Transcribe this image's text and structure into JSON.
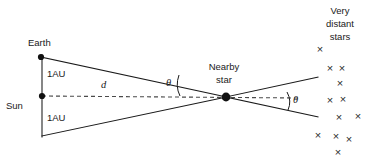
{
  "diagram": {
    "background_color": "#ffffff",
    "line_color": "#1a1a1a",
    "dash_color": "#4a4a4a",
    "labels": {
      "earth": "Earth",
      "sun": "Sun",
      "au_top": "1AU",
      "au_bottom": "1AU",
      "distance": "d",
      "theta_left": "θ",
      "theta_right": "θ",
      "nearby_star_line1": "Nearby",
      "nearby_star_line2": "star",
      "distant_line1": "Very",
      "distant_line2": "distant",
      "distant_line3": "stars"
    },
    "nodes": [
      {
        "name": "earth",
        "x": 41,
        "y": 57,
        "radius": 3.1
      },
      {
        "name": "sun",
        "x": 42,
        "y": 96,
        "radius": 3.1
      },
      {
        "name": "nearby-star",
        "x": 226,
        "y": 97,
        "radius": 4.4
      }
    ],
    "baseline": {
      "x": 42,
      "y_top": 57,
      "y_bottom": 136
    },
    "sight_lines": [
      {
        "name": "earth-to-star",
        "x1": 41,
        "y1": 57,
        "x2": 226,
        "y2": 97
      },
      {
        "name": "opposition-to-star",
        "x1": 42,
        "y1": 136,
        "x2": 226,
        "y2": 97
      },
      {
        "name": "star-to-distant-upper",
        "x1": 226,
        "y1": 97,
        "x2": 318,
        "y2": 77
      },
      {
        "name": "star-to-distant-lower",
        "x1": 226,
        "y1": 97,
        "x2": 318,
        "y2": 117
      }
    ],
    "dashed_axis": {
      "x1": 42,
      "y1": 96,
      "x2": 300,
      "y2": 98
    },
    "distant_stars": [
      {
        "x": 320,
        "y": 50
      },
      {
        "x": 330,
        "y": 69
      },
      {
        "x": 342,
        "y": 69
      },
      {
        "x": 340,
        "y": 84
      },
      {
        "x": 330,
        "y": 101
      },
      {
        "x": 343,
        "y": 100
      },
      {
        "x": 339,
        "y": 118
      },
      {
        "x": 358,
        "y": 117
      },
      {
        "x": 318,
        "y": 136
      },
      {
        "x": 336,
        "y": 137
      },
      {
        "x": 349,
        "y": 140
      },
      {
        "x": 338,
        "y": 153
      }
    ]
  }
}
